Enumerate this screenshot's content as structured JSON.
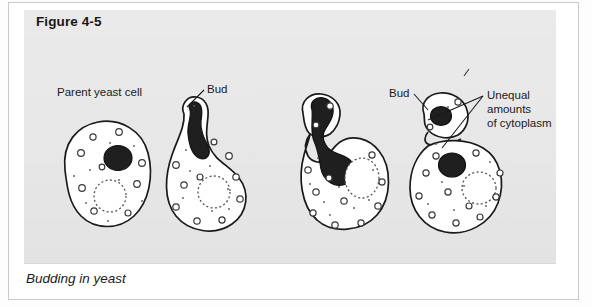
{
  "figure": {
    "title": "Figure 4-5",
    "caption": "Budding in yeast",
    "subject": "Budding in yeast"
  },
  "colors": {
    "page_background": "#ffffff",
    "panel_background": "#e9e9e9",
    "frame_border": "#c9c9c9",
    "ink": "#1a1a1a",
    "nucleus_fill": "#1f1f1f",
    "cytoplasm_fill": "#ffffff",
    "organelle_stroke": "#3a3a3a",
    "vacuole_stroke": "#555555",
    "title_text": "#171717",
    "caption_text": "#1b1b1b"
  },
  "labels": [
    {
      "id": "parent-yeast-cell",
      "text": "Parent yeast cell",
      "x": 33,
      "y": 76,
      "leader": false
    },
    {
      "id": "bud-stage-2",
      "text": "Bud",
      "x": 183,
      "y": 73,
      "leader": true
    },
    {
      "id": "bud-stage-4",
      "text": "Bud",
      "x": 365,
      "y": 77,
      "leader": true
    },
    {
      "id": "unequal-line-1",
      "text": "Unequal",
      "x": 463,
      "y": 79,
      "leader": true
    },
    {
      "id": "unequal-line-2",
      "text": "amounts",
      "x": 463,
      "y": 93,
      "leader": false
    },
    {
      "id": "unequal-line-3",
      "text": "of cytoplasm",
      "x": 463,
      "y": 107,
      "leader": false
    }
  ],
  "stages": [
    {
      "index": 1,
      "name": "parent-yeast-cell",
      "description": "Parent yeast cell with single nucleus and vacuole; no bud.",
      "has_bud": false,
      "nucleus_state": "single round nucleus",
      "vacuole": true
    },
    {
      "index": 2,
      "name": "bud-emerging",
      "description": "Small bud emerges at top-left; nucleus elongates toward the bud neck.",
      "has_bud": true,
      "nucleus_state": "elongated nucleus stretching into bud neck",
      "vacuole": true
    },
    {
      "index": 3,
      "name": "nucleus-dividing",
      "description": "Bud enlarges; nucleus divides as a dumbbell shape across the neck.",
      "has_bud": true,
      "nucleus_state": "dumbbell-shaped dividing nucleus spanning the neck",
      "vacuole": true
    },
    {
      "index": 4,
      "name": "bud-separating",
      "description": "Daughter bud with its own nucleus separates from parent; unequal amounts of cytoplasm.",
      "has_bud": true,
      "nucleus_state": "two separate round nuclei, one in bud one in parent",
      "vacuole": true
    }
  ]
}
